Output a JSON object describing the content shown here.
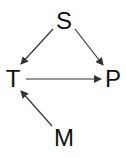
{
  "diagram": {
    "nodes": [
      {
        "id": "S",
        "label": "S",
        "x": 64,
        "y": 21
      },
      {
        "id": "T",
        "label": "T",
        "x": 13,
        "y": 79
      },
      {
        "id": "P",
        "label": "P",
        "x": 113,
        "y": 79
      },
      {
        "id": "M",
        "label": "M",
        "x": 64,
        "y": 138
      }
    ],
    "edges": [
      {
        "from": "S",
        "to": "T"
      },
      {
        "from": "S",
        "to": "P"
      },
      {
        "from": "T",
        "to": "P"
      },
      {
        "from": "M",
        "to": "T"
      }
    ],
    "colors": {
      "line": "#333333",
      "text": "#111111",
      "background": "#ffffff"
    }
  }
}
